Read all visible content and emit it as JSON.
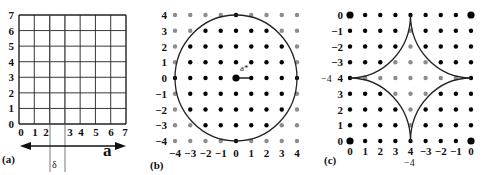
{
  "figure": {
    "panels": [
      {
        "id": "a",
        "label": "(a)",
        "type": "grid",
        "grid_size": 7,
        "y_ticks": [
          "0",
          "1",
          "2",
          "3",
          "4",
          "5",
          "6",
          "7"
        ],
        "x_ticks": [
          "0",
          "1",
          "2",
          "3",
          "4",
          "5",
          "6",
          "7"
        ],
        "arrow_label": "a",
        "gap_label": "δ",
        "gap_between": [
          2,
          3
        ]
      },
      {
        "id": "b",
        "label": "(b)",
        "type": "lattice-circle",
        "range": [
          -4,
          4
        ],
        "x_ticks": [
          "−4",
          "−3",
          "−2",
          "−1",
          "0",
          "1",
          "2",
          "3",
          "4"
        ],
        "y_ticks": [
          "4",
          "3",
          "2",
          "1",
          "0",
          "−1",
          "−2",
          "−3",
          "−4"
        ],
        "circle_radius": 4,
        "inside_color": "#000000",
        "outside_color": "#8c8c8c",
        "vector_label": "a*"
      },
      {
        "id": "c",
        "label": "(c)",
        "type": "lattice-astroid",
        "x_ticks": [
          "0",
          "1",
          "2",
          "3",
          "4",
          "−3",
          "−2",
          "−1",
          "0"
        ],
        "x_sublabel": "−4",
        "y_ticks": [
          "0",
          "−1",
          "−2",
          "−3",
          "4",
          "3",
          "2",
          "1",
          "0"
        ],
        "y_sublabel": "−4",
        "gray_points": [
          [
            4,
            1
          ],
          [
            4,
            2
          ],
          [
            3,
            3
          ],
          [
            4,
            3
          ],
          [
            5,
            3
          ],
          [
            1,
            4
          ],
          [
            2,
            4
          ],
          [
            3,
            4
          ],
          [
            4,
            4
          ],
          [
            5,
            4
          ],
          [
            6,
            4
          ],
          [
            7,
            4
          ],
          [
            3,
            5
          ],
          [
            4,
            5
          ],
          [
            5,
            5
          ],
          [
            4,
            6
          ],
          [
            4,
            7
          ]
        ],
        "inside_color": "#8c8c8c",
        "outside_color": "#000000"
      }
    ]
  }
}
